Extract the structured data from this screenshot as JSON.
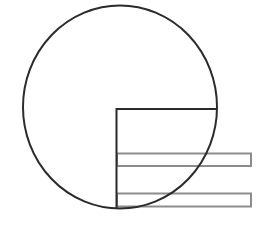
{
  "diagram": {
    "colors": {
      "background": "#ffffff",
      "outline": "#2b2b2b",
      "bar_outline": "#8c8c8c"
    },
    "circle": {
      "cx": 120,
      "cy": 107,
      "rx": 97,
      "ry": 101.5,
      "stroke_width": 2
    },
    "corner": {
      "x": 116.5,
      "y_top": 109,
      "y_bottom": 208,
      "x_right": 217,
      "stroke_width": 2
    },
    "bars": [
      {
        "x": 117,
        "y": 153.5,
        "width": 134,
        "height": 12.5
      },
      {
        "x": 117,
        "y": 193.5,
        "width": 134,
        "height": 13
      }
    ]
  }
}
